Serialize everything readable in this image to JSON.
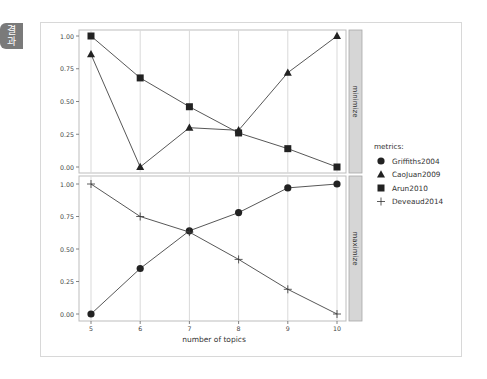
{
  "side_tab": {
    "label_line1": "결",
    "label_line2": "과"
  },
  "chart_data": {
    "type": "line",
    "xlabel": "number of topics",
    "x": [
      5,
      6,
      7,
      8,
      9,
      10
    ],
    "yticks": [
      "0.00",
      "0.25",
      "0.50",
      "0.75",
      "1.00"
    ],
    "ylim": [
      0,
      1
    ],
    "grid": true,
    "legend": {
      "title": "metrics:",
      "position": "right",
      "entries": [
        {
          "name": "Griffiths2004",
          "marker": "circle"
        },
        {
          "name": "CaoJuan2009",
          "marker": "triangle"
        },
        {
          "name": "Arun2010",
          "marker": "square"
        },
        {
          "name": "Deveaud2014",
          "marker": "plus"
        }
      ]
    },
    "panels": [
      {
        "facet": "minimize",
        "series": [
          {
            "name": "CaoJuan2009",
            "marker": "triangle",
            "values": [
              0.86,
              0.0,
              0.3,
              0.28,
              0.72,
              1.0
            ]
          },
          {
            "name": "Arun2010",
            "marker": "square",
            "values": [
              1.0,
              0.68,
              0.46,
              0.26,
              0.14,
              0.0
            ]
          }
        ]
      },
      {
        "facet": "maximize",
        "series": [
          {
            "name": "Griffiths2004",
            "marker": "circle",
            "values": [
              0.0,
              0.35,
              0.64,
              0.78,
              0.97,
              1.0
            ]
          },
          {
            "name": "Deveaud2014",
            "marker": "plus",
            "values": [
              1.0,
              0.75,
              0.63,
              0.42,
              0.19,
              0.0
            ]
          }
        ]
      }
    ]
  }
}
